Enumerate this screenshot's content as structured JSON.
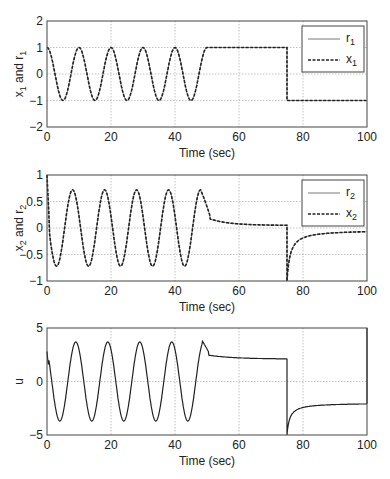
{
  "chart_data": [
    {
      "type": "line",
      "id": "x1",
      "ylabel_main": "x",
      "ylabel_sub1": "1",
      "ylabel_mid": " and r",
      "ylabel_sub2": "1",
      "xlabel": "Time (sec)",
      "xlim": [
        0,
        100
      ],
      "ylim": [
        -2,
        2
      ],
      "xticks": [
        0,
        20,
        40,
        60,
        80,
        100
      ],
      "yticks": [
        -2,
        -1,
        0,
        1,
        2
      ],
      "grid": true,
      "legend": {
        "placement": "top-right",
        "entries": [
          {
            "name": "r",
            "sub": "1",
            "style": "solid"
          },
          {
            "name": "x",
            "sub": "1",
            "style": "dashed"
          }
        ]
      },
      "series": [
        {
          "name": "r1",
          "style": "solid",
          "description": "cos(2*pi*t/10) for t<50; 1 for 50<=t<75; -1 for t>=75"
        },
        {
          "name": "x1",
          "style": "dashed",
          "description": "tracks r1"
        }
      ],
      "x": [
        0,
        2.5,
        5,
        7.5,
        10,
        12.5,
        15,
        17.5,
        20,
        22.5,
        25,
        27.5,
        30,
        32.5,
        35,
        37.5,
        40,
        42.5,
        45,
        47.5,
        50,
        60,
        74.9,
        75,
        80,
        90,
        100
      ],
      "values": [
        1,
        0,
        -1,
        0,
        1,
        0,
        -1,
        0,
        1,
        0,
        -1,
        0,
        1,
        0,
        -1,
        0,
        1,
        0,
        -1,
        0,
        1,
        1,
        1,
        -1,
        -1,
        -1,
        -1
      ]
    },
    {
      "type": "line",
      "id": "x2",
      "ylabel_main": "x",
      "ylabel_sub1": "2",
      "ylabel_mid": " and r",
      "ylabel_sub2": "2",
      "xlabel": "Time (sec)",
      "xlim": [
        0,
        100
      ],
      "ylim": [
        -1,
        1
      ],
      "xticks": [
        0,
        20,
        40,
        60,
        80,
        100
      ],
      "yticks": [
        -1,
        -0.5,
        0,
        0.5,
        1
      ],
      "yticklabels": [
        "−1",
        "−0.5",
        "0",
        "0.5",
        "1"
      ],
      "grid": true,
      "legend": {
        "placement": "top-right",
        "entries": [
          {
            "name": "r",
            "sub": "2",
            "style": "solid"
          },
          {
            "name": "x",
            "sub": "2",
            "style": "dashed"
          }
        ]
      },
      "series": [
        {
          "name": "r2",
          "style": "solid"
        },
        {
          "name": "x2",
          "style": "dashed"
        }
      ],
      "x": [
        0,
        1,
        3,
        8,
        13,
        18,
        23,
        28,
        33,
        38,
        43,
        48,
        50,
        52,
        60,
        74.9,
        75,
        76,
        78,
        80,
        90,
        100
      ],
      "values": [
        1,
        0,
        -0.72,
        0.72,
        -0.72,
        0.72,
        -0.72,
        0.72,
        -0.72,
        0.72,
        -0.72,
        0.72,
        0.3,
        0.15,
        0.08,
        0.05,
        -1,
        -0.45,
        -0.25,
        -0.17,
        -0.08,
        -0.04
      ]
    },
    {
      "type": "line",
      "id": "u",
      "ylabel_main": "u",
      "xlabel": "Time (sec)",
      "xlim": [
        0,
        100
      ],
      "ylim": [
        -5,
        5
      ],
      "xticks": [
        0,
        20,
        40,
        60,
        80,
        100
      ],
      "yticks": [
        -5,
        0,
        5
      ],
      "yticklabels": [
        "−5",
        "0",
        "5"
      ],
      "grid": true,
      "series": [
        {
          "name": "u",
          "style": "solid"
        }
      ],
      "x": [
        0,
        1,
        4,
        9,
        14,
        19,
        24,
        29,
        34,
        39,
        44,
        48.5,
        50,
        52,
        60,
        74.9,
        75,
        76,
        78,
        80,
        90,
        100
      ],
      "values": [
        2.8,
        0,
        -3.6,
        3.8,
        -3.6,
        3.8,
        -3.6,
        3.8,
        -3.6,
        3.8,
        -3.6,
        3.8,
        2.8,
        2.5,
        2.3,
        2.1,
        -5,
        -3.5,
        -2.7,
        -2.4,
        -2.1,
        -2.0
      ]
    }
  ]
}
